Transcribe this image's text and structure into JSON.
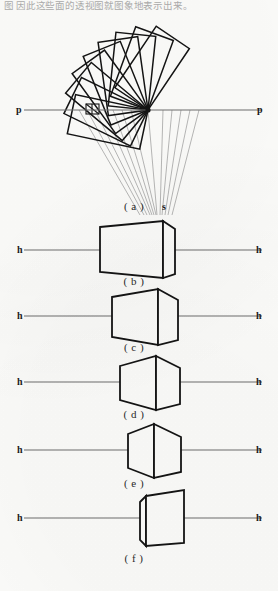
{
  "page": {
    "header_text": "图 因此这些面的透视图就图象地表示出来。",
    "width": 278,
    "height": 591,
    "background": "#fdfdfb",
    "ink_color": "#141414",
    "rule_color": "#6e6e6e"
  },
  "figure": {
    "title_implied": "Rotation of a plane about a picture-plane axis and the resulting perspective views",
    "panels": [
      {
        "id": "a",
        "caption": "( a )",
        "caption_x": 110,
        "caption_y": 200,
        "type": "rotation-fan",
        "axis": {
          "name": "picture-plane-line",
          "label_left": "p",
          "label_right": "p",
          "label_left_x": 16,
          "label_right_x": 257,
          "label_y": 104,
          "y": 110,
          "x_start": 24,
          "x_end": 262
        },
        "pivot": {
          "x": 148,
          "y": 110,
          "label": ""
        },
        "station_point": {
          "label": "s",
          "x": 162,
          "y": 201,
          "point_x": 157,
          "point_y": 206
        },
        "rect_count": 9,
        "rect_angles_deg": [
          12,
          26,
          40,
          54,
          68,
          82,
          96,
          110,
          124
        ],
        "rect_width": 74,
        "rect_height": 40,
        "flat_rect": {
          "x": 86,
          "y": 106,
          "w": 15,
          "h": 9,
          "note": "edge-on rectangle at the picture plane"
        },
        "projector_count": 11,
        "projector_note": "light rays from the fan corners descending to station point s"
      },
      {
        "id": "b",
        "caption": "( b )",
        "caption_x": 110,
        "caption_y": 275,
        "type": "box-view",
        "horizon": {
          "label_left": "h",
          "label_right": "h",
          "label_left_x": 17,
          "label_right_x": 256,
          "label_y": 244,
          "y": 250,
          "x_start": 24,
          "x_end": 262
        },
        "box": {
          "front_left_x": 100,
          "front_right_x": 163,
          "top_y": 226,
          "bottom_y": 273,
          "side_width": 12,
          "side_top_offset": -8,
          "side_bottom_offset": -4,
          "variant": "wide-front-narrow-side"
        }
      },
      {
        "id": "c",
        "caption": "( c )",
        "caption_x": 110,
        "caption_y": 341,
        "type": "box-view",
        "horizon": {
          "label_left": "h",
          "label_right": "h",
          "label_left_x": 17,
          "label_right_x": 256,
          "label_y": 310,
          "y": 316,
          "x_start": 24,
          "x_end": 262
        },
        "box": {
          "front_left_x": 112,
          "front_right_x": 158,
          "top_y": 296,
          "bottom_y": 340,
          "side_width": 19,
          "side_top_offset": -12,
          "side_bottom_offset": -6,
          "variant": "narrower-front-wider-side"
        }
      },
      {
        "id": "d",
        "caption": "( d )",
        "caption_x": 110,
        "caption_y": 408,
        "type": "box-view",
        "horizon": {
          "label_left": "h",
          "label_right": "h",
          "label_left_x": 17,
          "label_right_x": 256,
          "label_y": 376,
          "y": 382,
          "x_start": 24,
          "x_end": 262
        },
        "box": {
          "front_left_x": 120,
          "front_right_x": 156,
          "top_y": 361,
          "bottom_y": 406,
          "side_width": 22,
          "side_top_offset": -16,
          "side_bottom_offset": -8,
          "variant": "near-cube-hexagonal"
        }
      },
      {
        "id": "e",
        "caption": "( e )",
        "caption_x": 110,
        "caption_y": 477,
        "type": "box-view",
        "horizon": {
          "label_left": "h",
          "label_right": "h",
          "label_left_x": 17,
          "label_right_x": 256,
          "label_y": 444,
          "y": 450,
          "x_start": 24,
          "x_end": 262
        },
        "box": {
          "front_left_x": 128,
          "front_right_x": 154,
          "top_y": 429,
          "bottom_y": 474,
          "side_width": 26,
          "side_top_offset": -17,
          "side_bottom_offset": -9,
          "variant": "cube-hexagonal"
        }
      },
      {
        "id": "f",
        "caption": "( f )",
        "caption_x": 110,
        "caption_y": 552,
        "type": "box-view",
        "horizon": {
          "label_left": "h",
          "label_right": "h",
          "label_left_x": 17,
          "label_right_x": 256,
          "label_y": 512,
          "y": 518,
          "x_start": 24,
          "x_end": 262
        },
        "box": {
          "front_left_x": 140,
          "front_right_x": 143,
          "top_y": 496,
          "bottom_y": 543,
          "side_width": 33,
          "side_top_offset": -10,
          "side_bottom_offset": -5,
          "variant": "narrow-left-wide-right"
        }
      }
    ]
  }
}
